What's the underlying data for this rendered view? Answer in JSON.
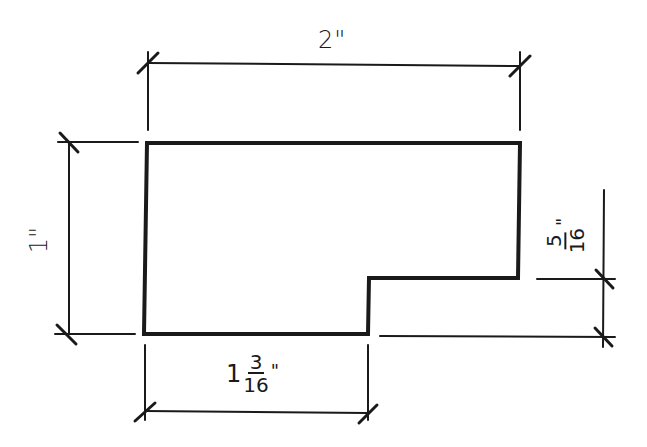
{
  "drawing": {
    "type": "dimensioned shop drawing",
    "stroke_color": "#1a1a1a",
    "background": "#ffffff",
    "shape": "L-shaped profile (rectangle with notch cut from lower-right corner)"
  },
  "dimensions": {
    "overall_width": {
      "label": "2\"",
      "value_in": 2
    },
    "overall_height": {
      "label": "1\"",
      "value_in": 1
    },
    "bottom_width": {
      "whole": "1",
      "numerator": "3",
      "denominator": "16",
      "inch_mark": "\"",
      "value_in": 1.1875
    },
    "notch_height": {
      "whole": "",
      "numerator": "5",
      "denominator": "16",
      "inch_mark": "\"",
      "value_in": 0.3125
    }
  }
}
